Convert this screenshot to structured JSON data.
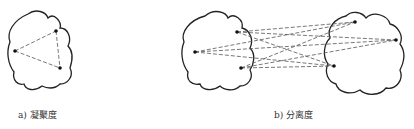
{
  "figure": {
    "panels": [
      {
        "id": "a",
        "caption": "a) 凝聚度",
        "cluster_outlines": [
          "M28,14 C36,8 46,12 48,18 C54,12 62,22 60,28 C68,28 72,38 68,46 C74,52 72,62 70,68 C74,76 68,84 60,84 C54,90 46,88 42,86 C34,92 26,90 24,84 C18,86 12,80 14,72 C8,64 6,52 10,42 C6,32 14,20 28,14 Z"
        ],
        "points": [
          [
            15,
            51
          ],
          [
            56,
            31
          ],
          [
            60,
            68
          ]
        ],
        "edges": [
          [
            0,
            1
          ],
          [
            1,
            2
          ],
          [
            0,
            2
          ]
        ]
      },
      {
        "id": "b",
        "caption": "b) 分离度",
        "cluster_outlines": [
          "M205,16 C214,8 226,12 228,18 C234,12 244,20 242,28 C250,30 254,40 250,48 C256,54 254,64 250,70 C254,78 248,86 240,86 C234,92 224,90 220,86 C212,92 202,90 200,84 C192,86 186,80 188,72 C182,64 180,52 184,42 C180,32 190,20 205,16 Z",
          "M346,16 C352,10 362,12 366,18 C374,10 388,16 390,24 C398,26 404,36 400,44 C406,52 404,62 400,70 C404,80 396,90 386,88 C380,96 366,96 360,90 C350,96 338,92 336,84 C328,82 324,72 328,64 C322,56 324,44 330,38 C326,28 336,18 346,16 Z"
        ],
        "points": [
          [
            195,
            52
          ],
          [
            237,
            32
          ],
          [
            241,
            68
          ],
          [
            355,
            22
          ],
          [
            396,
            40
          ],
          [
            334,
            66
          ]
        ],
        "edges": [
          [
            0,
            3
          ],
          [
            0,
            4
          ],
          [
            0,
            5
          ],
          [
            1,
            3
          ],
          [
            1,
            4
          ],
          [
            1,
            5
          ],
          [
            2,
            3
          ],
          [
            2,
            4
          ],
          [
            2,
            5
          ]
        ]
      }
    ],
    "colors": {
      "stroke": "#222222",
      "dash": "#555555",
      "point": "#111111"
    }
  }
}
